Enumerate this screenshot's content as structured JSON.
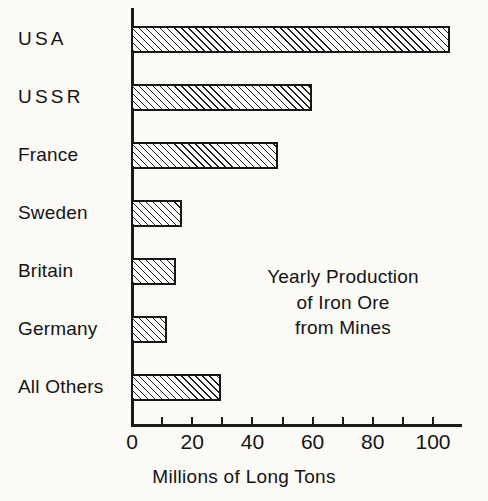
{
  "chart_data": {
    "type": "bar",
    "orientation": "horizontal",
    "title": "",
    "annotation_lines": [
      "Yearly Production",
      "of Iron Ore",
      "from Mines"
    ],
    "categories": [
      "USA",
      "USSR",
      "France",
      "Sweden",
      "Britain",
      "Germany",
      "All Others"
    ],
    "values": [
      106,
      60,
      49,
      17,
      15,
      12,
      30
    ],
    "xlabel": "Millions of Long Tons",
    "ylabel": "",
    "xlim": [
      0,
      110
    ],
    "xticks": [
      0,
      10,
      20,
      30,
      40,
      50,
      60,
      70,
      80,
      90,
      100
    ],
    "xticklabels_shown": [
      "0",
      "20",
      "40",
      "60",
      "80",
      "100"
    ],
    "xticklabel_values": [
      0,
      20,
      40,
      60,
      80,
      100
    ],
    "grid": false,
    "legend": false,
    "bar_fill": "diagonal-hatch",
    "bar_edge_color": "#151515",
    "background_color": "#fbfaf7",
    "text_color": "#141414"
  },
  "axis": {
    "x_title": "Millions of Long Tons"
  },
  "series": [
    {
      "label": "USA",
      "value": 106,
      "letter_spaced": true
    },
    {
      "label": "USSR",
      "value": 60,
      "letter_spaced": true
    },
    {
      "label": "France",
      "value": 49,
      "letter_spaced": false
    },
    {
      "label": "Sweden",
      "value": 17,
      "letter_spaced": false
    },
    {
      "label": "Britain",
      "value": 15,
      "letter_spaced": false
    },
    {
      "label": "Germany",
      "value": 12,
      "letter_spaced": false
    },
    {
      "label": "All Others",
      "value": 30,
      "letter_spaced": false
    }
  ],
  "ticks": [
    {
      "value": 0,
      "label": "0"
    },
    {
      "value": 10,
      "label": ""
    },
    {
      "value": 20,
      "label": "20"
    },
    {
      "value": 30,
      "label": ""
    },
    {
      "value": 40,
      "label": "40"
    },
    {
      "value": 50,
      "label": ""
    },
    {
      "value": 60,
      "label": "60"
    },
    {
      "value": 70,
      "label": ""
    },
    {
      "value": 80,
      "label": "80"
    },
    {
      "value": 90,
      "label": ""
    },
    {
      "value": 100,
      "label": "100"
    }
  ],
  "annotation": {
    "line1": "Yearly Production",
    "line2": "of Iron Ore",
    "line3": "from Mines"
  }
}
